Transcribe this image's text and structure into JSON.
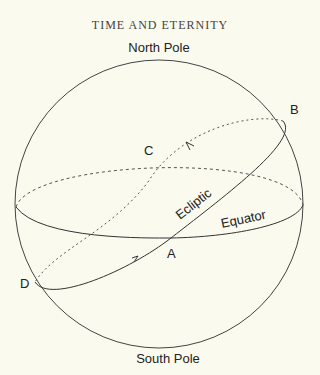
{
  "page": {
    "running_header": "TIME AND ETERNITY"
  },
  "diagram": {
    "labels": {
      "north_pole": "North Pole",
      "south_pole": "South Pole",
      "point_a": "A",
      "point_b": "B",
      "point_c": "C",
      "point_d": "D",
      "ecliptic": "Ecliptic",
      "equator": "Equator"
    },
    "colors": {
      "background": "#fbfaee",
      "line": "#333333",
      "text": "#222222"
    }
  }
}
